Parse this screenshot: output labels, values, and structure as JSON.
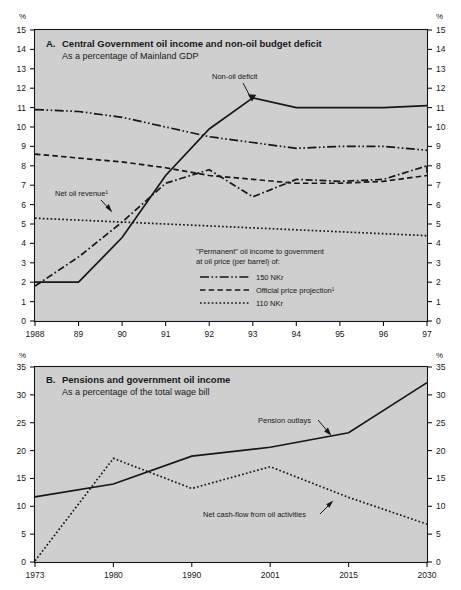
{
  "figure": {
    "top_title": "",
    "background": "#cfcfcf",
    "ink": "#15171a"
  },
  "panelA": {
    "letter": "A.",
    "title": "Central Government oil income and non-oil budget deficit",
    "subtitle": "As a percentage of Mainland GDP",
    "unit_left": "%",
    "unit_right": "%",
    "annotations": [
      {
        "name": "non-oil-deficit",
        "text": "Non-oil deficit"
      },
      {
        "name": "net-oil-revenue",
        "text": "Net oil revenue¹"
      }
    ],
    "legend": {
      "heading_line1": "\"Permanent\" oil income to government",
      "heading_line2": "at oil price (per barrel) of:",
      "items": [
        {
          "label": "150 NKr",
          "style": "dash-dot-dot"
        },
        {
          "label": "Official price projection¹",
          "style": "dashed"
        },
        {
          "label": "110 NKr",
          "style": "dotted"
        }
      ]
    }
  },
  "panelB": {
    "letter": "B.",
    "title": "Pensions and government oil income",
    "subtitle": "As a percentage of the total wage bill",
    "unit_left": "%",
    "unit_right": "%",
    "annotations": [
      {
        "name": "pension-outlays",
        "text": "Pension outlays"
      },
      {
        "name": "net-cash-flow",
        "text": "Net cash-flow from oil activities"
      }
    ]
  },
  "chart_data": [
    {
      "id": "panel-a",
      "type": "line",
      "title": "A. Central Government oil income and non-oil budget deficit",
      "subtitle": "As a percentage of Mainland GDP",
      "xlabel": "",
      "ylabel": "%",
      "ylim": [
        0,
        15
      ],
      "ytick_step": 1,
      "yticks": [
        0,
        1,
        2,
        3,
        4,
        5,
        6,
        7,
        8,
        9,
        10,
        11,
        12,
        13,
        14,
        15
      ],
      "x": [
        1988,
        1989,
        1990,
        1991,
        1992,
        1993,
        1994,
        1995,
        1996,
        1997
      ],
      "xtick_labels": [
        "1988",
        "89",
        "90",
        "91",
        "92",
        "93",
        "94",
        "95",
        "96",
        "97"
      ],
      "grid": false,
      "legend_position": "inside-center",
      "series": [
        {
          "name": "Non-oil deficit",
          "style": "solid",
          "values": [
            2.0,
            2.0,
            4.3,
            7.5,
            9.9,
            11.5,
            11.0,
            11.0,
            11.0,
            11.1
          ]
        },
        {
          "name": "Net oil revenue",
          "style": "dash-dot",
          "values": [
            1.8,
            3.3,
            5.1,
            7.1,
            7.8,
            6.4,
            7.3,
            7.2,
            7.3,
            8.0
          ]
        },
        {
          "name": "150 NKr",
          "style": "dash-dot-dot",
          "values": [
            10.9,
            10.8,
            10.5,
            10.0,
            9.5,
            9.2,
            8.9,
            9.0,
            9.0,
            8.8
          ]
        },
        {
          "name": "Official price projection",
          "style": "dashed",
          "values": [
            8.6,
            8.4,
            8.2,
            7.9,
            7.5,
            7.3,
            7.1,
            7.1,
            7.2,
            7.5
          ]
        },
        {
          "name": "110 NKr",
          "style": "dotted",
          "values": [
            5.3,
            5.2,
            5.1,
            5.0,
            4.9,
            4.8,
            4.7,
            4.6,
            4.5,
            4.4
          ]
        }
      ],
      "series_extra_tail": {
        "Net oil revenue": [
          7.5
        ]
      }
    },
    {
      "id": "panel-b",
      "type": "line",
      "title": "B. Pensions and government oil income",
      "subtitle": "As a percentage of the total wage bill",
      "xlabel": "",
      "ylabel": "%",
      "ylim": [
        0,
        35
      ],
      "ytick_step": 5,
      "yticks": [
        0,
        5,
        10,
        15,
        20,
        25,
        30,
        35
      ],
      "x": [
        1973,
        1980,
        1990,
        2001,
        2015,
        2030
      ],
      "xtick_labels": [
        "1973",
        "1980",
        "1990",
        "2001",
        "2015",
        "2030"
      ],
      "grid": false,
      "legend_position": "none",
      "series": [
        {
          "name": "Pension outlays",
          "style": "solid",
          "values": [
            11.7,
            14.0,
            19.0,
            20.6,
            23.2,
            32.2
          ]
        },
        {
          "name": "Net cash-flow from oil activities",
          "style": "dotted",
          "values": [
            0.2,
            18.6,
            13.2,
            17.1,
            11.6,
            6.8
          ]
        }
      ]
    }
  ]
}
